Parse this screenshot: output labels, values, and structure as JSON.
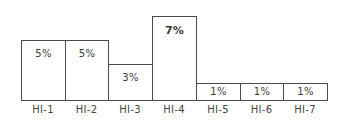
{
  "chart_data": {
    "type": "bar",
    "title": "",
    "xlabel": "",
    "ylabel": "",
    "categories": [
      "HI-1",
      "HI-2",
      "HI-3",
      "HI-4",
      "HI-5",
      "HI-6",
      "HI-7"
    ],
    "values": [
      5,
      5,
      3,
      7,
      1,
      1,
      1
    ],
    "value_labels": [
      "5%",
      "5%",
      "3%",
      "7%",
      "1%",
      "1%",
      "1%"
    ],
    "unit": "%",
    "ylim": [
      0,
      7
    ],
    "grid": false,
    "legend": null,
    "bar_gap": 0,
    "highlight": {
      "category": "HI-4",
      "label_bold": true
    }
  },
  "colors": {
    "bar_fill": "#ffffff",
    "bar_border": "#4a4a4a",
    "text": "#3a3a3a"
  }
}
